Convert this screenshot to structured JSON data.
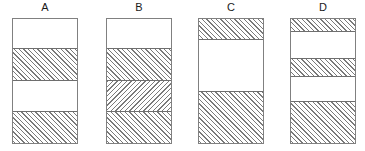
{
  "figure": {
    "title": "",
    "background_color": "#ffffff",
    "outline_color": "#808080",
    "hatch_color": "#7a7a7a",
    "width": 365,
    "height": 151
  },
  "chart_data": {
    "type": "bar",
    "title": "",
    "xlabel": "",
    "ylabel": "",
    "categories": [
      "A",
      "B",
      "C",
      "D"
    ],
    "axis": {
      "grid": false,
      "ticks_visible": false,
      "ylim": [
        0,
        126
      ]
    },
    "legend": {
      "visible": false,
      "entries": []
    },
    "bars": [
      {
        "label": "A",
        "left": 12,
        "width": 66,
        "top": 18,
        "height": 126,
        "bands": [
          {
            "fill": "blank",
            "top": 0,
            "height": 29,
            "fraction": 0.23
          },
          {
            "fill": "hatch-right",
            "top": 29,
            "height": 32,
            "fraction": 0.254
          },
          {
            "fill": "blank",
            "top": 61,
            "height": 31,
            "fraction": 0.246
          },
          {
            "fill": "hatch-right",
            "top": 92,
            "height": 34,
            "fraction": 0.27
          }
        ]
      },
      {
        "label": "B",
        "left": 106,
        "width": 66,
        "top": 18,
        "height": 126,
        "bands": [
          {
            "fill": "blank",
            "top": 0,
            "height": 29,
            "fraction": 0.23
          },
          {
            "fill": "hatch-right",
            "top": 29,
            "height": 32,
            "fraction": 0.254
          },
          {
            "fill": "hatch-left",
            "top": 61,
            "height": 31,
            "fraction": 0.246
          },
          {
            "fill": "hatch-right",
            "top": 92,
            "height": 34,
            "fraction": 0.27
          }
        ]
      },
      {
        "label": "C",
        "left": 198,
        "width": 66,
        "top": 18,
        "height": 126,
        "bands": [
          {
            "fill": "hatch-right",
            "top": 0,
            "height": 20,
            "fraction": 0.159
          },
          {
            "fill": "blank",
            "top": 20,
            "height": 52,
            "fraction": 0.413
          },
          {
            "fill": "hatch-right",
            "top": 72,
            "height": 54,
            "fraction": 0.428
          }
        ]
      },
      {
        "label": "D",
        "left": 290,
        "width": 66,
        "top": 18,
        "height": 126,
        "bands": [
          {
            "fill": "hatch-right",
            "top": 0,
            "height": 12,
            "fraction": 0.095
          },
          {
            "fill": "blank",
            "top": 12,
            "height": 27,
            "fraction": 0.214
          },
          {
            "fill": "hatch-right",
            "top": 39,
            "height": 18,
            "fraction": 0.143
          },
          {
            "fill": "blank",
            "top": 57,
            "height": 25,
            "fraction": 0.198
          },
          {
            "fill": "hatch-right",
            "top": 82,
            "height": 44,
            "fraction": 0.35
          }
        ]
      }
    ]
  }
}
